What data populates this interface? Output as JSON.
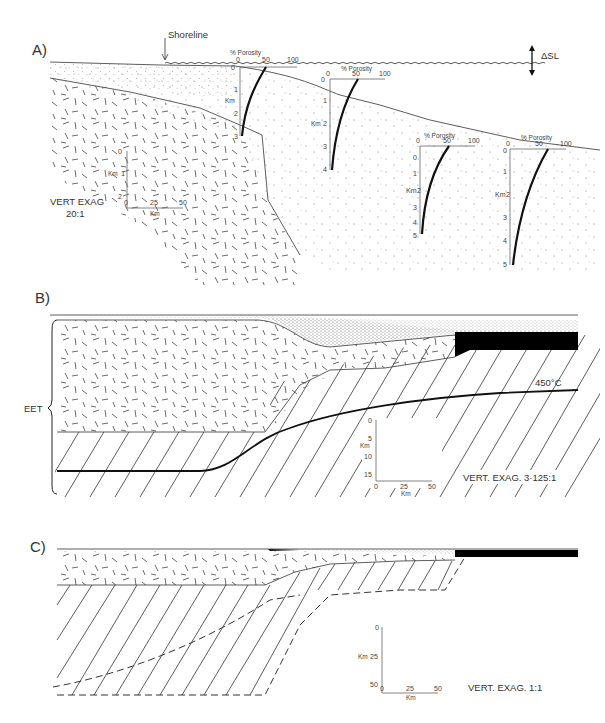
{
  "panels": {
    "a": {
      "label": "A)",
      "shoreline_label": "Shoreline",
      "sea_level_change_label": "ΔSL",
      "vert_exag_label": "VERT EXAG",
      "vert_exag_value": "20:1",
      "scale_vertical_unit": "Km",
      "scale_vertical_ticks": [
        "0",
        "1",
        "2"
      ],
      "scale_horizontal_ticks": [
        "0",
        "25",
        "50"
      ],
      "scale_horizontal_unit": "Km",
      "porosity_profiles": [
        {
          "title": "% Porosity",
          "x_ticks": [
            "0",
            "50",
            "100"
          ],
          "depth_unit": "Km",
          "depth_ticks": [
            "0",
            "1",
            "2",
            "3"
          ]
        },
        {
          "title": "% Porosity",
          "x_ticks": [
            "0",
            "50",
            "100"
          ],
          "depth_unit": "Km",
          "depth_ticks": [
            "0",
            "1",
            "2",
            "3",
            "4"
          ]
        },
        {
          "title": "% Porosity",
          "x_ticks": [
            "0",
            "50",
            "100"
          ],
          "depth_unit": "Km",
          "depth_ticks": [
            "0",
            "1",
            "2",
            "3",
            "4",
            "5"
          ]
        },
        {
          "title": "% Porosity",
          "x_ticks": [
            "0",
            "50",
            "100"
          ],
          "depth_unit": "Km",
          "depth_ticks": [
            "0",
            "1",
            "2",
            "3",
            "4",
            "5"
          ]
        }
      ]
    },
    "b": {
      "label": "B)",
      "eet_label": "EET",
      "isotherm_label": "450°C",
      "vert_exag_label": "VERT. EXAG. 3·125:1",
      "scale_vertical_unit": "Km",
      "scale_vertical_ticks": [
        "0",
        "5",
        "10",
        "15"
      ],
      "scale_horizontal_ticks": [
        "0",
        "25",
        "50"
      ],
      "scale_horizontal_unit": "Km"
    },
    "c": {
      "label": "C)",
      "vert_exag_label": "VERT. EXAG. 1:1",
      "scale_vertical_unit": "Km",
      "scale_vertical_ticks": [
        "0",
        "25",
        "50"
      ],
      "scale_horizontal_ticks": [
        "0",
        "25",
        "50"
      ],
      "scale_horizontal_unit": "Km"
    }
  }
}
